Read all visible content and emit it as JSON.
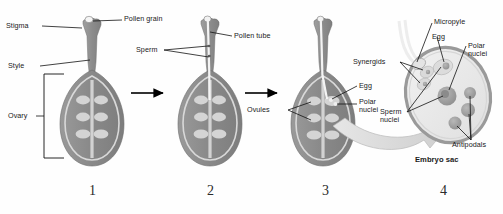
{
  "figure": {
    "background": "#fefefe",
    "ink": "#1a1a1a"
  },
  "palette": {
    "ovary_wall": "#8e8e8e",
    "style_gray": "#8a8a8a",
    "ovule_light": "#cfcfcf",
    "sac_fill": "#eaeaea",
    "sac_rim": "#9a9a9a",
    "nucleus": "#a0a0a0",
    "pollen_tube": "#f2f2f2",
    "arrow_black": "#000000",
    "curved_arrow": "#d8d8d8"
  },
  "stages": [
    {
      "number": "1",
      "labels": [
        {
          "name": "stigma",
          "text": "Stigma"
        },
        {
          "name": "pollen-grain",
          "text": "Pollen grain"
        },
        {
          "name": "style",
          "text": "Style"
        },
        {
          "name": "ovary",
          "text": "Ovary"
        }
      ]
    },
    {
      "number": "2",
      "labels": [
        {
          "name": "pollen-tube",
          "text": "Pollen tube"
        },
        {
          "name": "sperm",
          "text": "Sperm"
        }
      ]
    },
    {
      "number": "3",
      "labels": [
        {
          "name": "ovules",
          "text": "Ovules"
        },
        {
          "name": "egg",
          "text": "Egg"
        },
        {
          "name": "polar-nuclei",
          "text": "Polar\nnuclei"
        }
      ]
    },
    {
      "number": "4",
      "caption": "Embryo sac",
      "labels": [
        {
          "name": "micropyle",
          "text": "Micropyle"
        },
        {
          "name": "egg",
          "text": "Egg"
        },
        {
          "name": "polar-nuclei",
          "text": "Polar\nnuclei"
        },
        {
          "name": "synergids",
          "text": "Synergids"
        },
        {
          "name": "sperm-nuclei",
          "text": "Sperm\nnuclei"
        },
        {
          "name": "antipodals",
          "text": "Antipodals"
        }
      ]
    }
  ],
  "text": {
    "stigma": "Stigma",
    "pollen_grain": "Pollen grain",
    "style": "Style",
    "ovary": "Ovary",
    "pollen_tube": "Pollen tube",
    "sperm": "Sperm",
    "ovules": "Ovules",
    "egg3": "Egg",
    "polar_nuclei3_l1": "Polar",
    "polar_nuclei3_l2": "nuclei",
    "micropyle": "Micropyle",
    "egg4": "Egg",
    "polar_nuclei4_l1": "Polar",
    "polar_nuclei4_l2": "nuclei",
    "synergids": "Synergids",
    "sperm_nuclei_l1": "Sperm",
    "sperm_nuclei_l2": "nuclei",
    "antipodals": "Antipodals",
    "embryo_sac": "Embryo sac",
    "n1": "1",
    "n2": "2",
    "n3": "3",
    "n4": "4"
  }
}
